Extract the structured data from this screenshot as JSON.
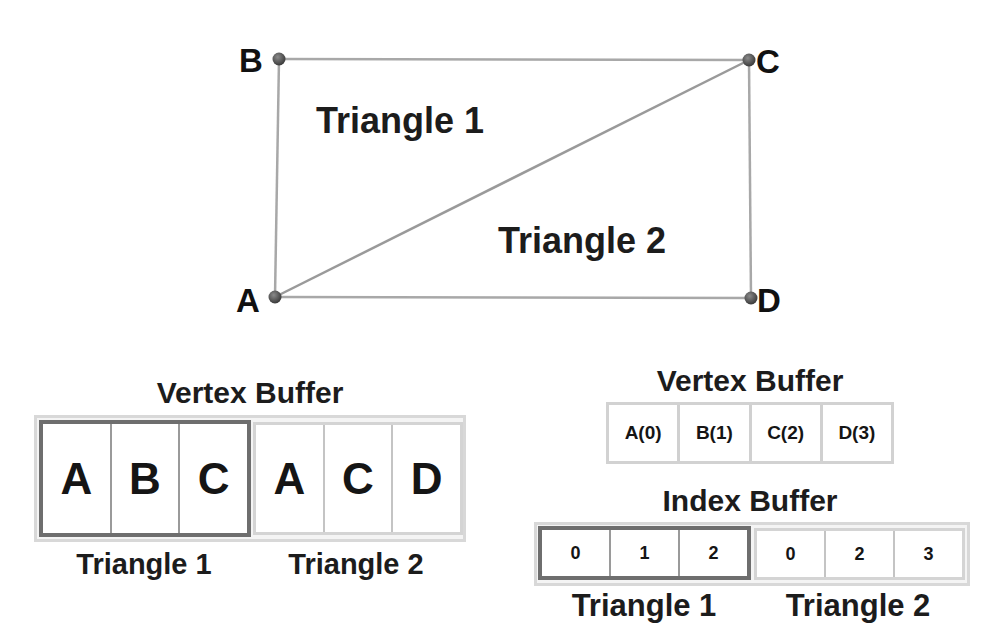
{
  "diagram": {
    "vertices": [
      {
        "name": "A",
        "x": 275,
        "y": 297
      },
      {
        "name": "B",
        "x": 279,
        "y": 59
      },
      {
        "name": "C",
        "x": 749,
        "y": 60
      },
      {
        "name": "D",
        "x": 751,
        "y": 298
      }
    ],
    "edges": [
      [
        "A",
        "B"
      ],
      [
        "B",
        "C"
      ],
      [
        "C",
        "D"
      ],
      [
        "D",
        "A"
      ],
      [
        "A",
        "C"
      ]
    ],
    "regions": [
      {
        "label": "Triangle 1"
      },
      {
        "label": "Triangle 2"
      }
    ],
    "colors": {
      "edge": "#a8a8a8",
      "vertex": "#4a4a4a",
      "highlight": "#6e6e6e",
      "cell_border": "#d0d0d0"
    }
  },
  "left_panel": {
    "title": "Vertex Buffer",
    "groups": [
      {
        "label": "Triangle 1",
        "cells": [
          "A",
          "B",
          "C"
        ],
        "highlighted": true
      },
      {
        "label": "Triangle 2",
        "cells": [
          "A",
          "C",
          "D"
        ],
        "highlighted": false
      }
    ]
  },
  "right_panel": {
    "vertex_buffer": {
      "title": "Vertex Buffer",
      "cells": [
        "A(0)",
        "B(1)",
        "C(2)",
        "D(3)"
      ]
    },
    "index_buffer": {
      "title": "Index Buffer",
      "groups": [
        {
          "label": "Triangle 1",
          "cells": [
            "0",
            "1",
            "2"
          ],
          "highlighted": true
        },
        {
          "label": "Triangle 2",
          "cells": [
            "0",
            "2",
            "3"
          ],
          "highlighted": false
        }
      ]
    }
  }
}
